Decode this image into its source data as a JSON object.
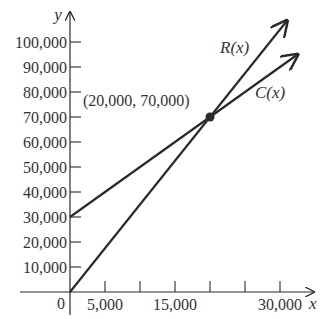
{
  "chart_data": {
    "type": "line",
    "title": "",
    "xlabel": "x",
    "ylabel": "y",
    "xlim": [
      0,
      33000
    ],
    "ylim": [
      0,
      105000
    ],
    "grid": false,
    "x_ticks": [
      5000,
      10000,
      15000,
      20000,
      25000,
      30000
    ],
    "x_tick_labels": [
      {
        "value": 5000,
        "label": "5,000"
      },
      {
        "value": 15000,
        "label": "15,000"
      },
      {
        "value": 30000,
        "label": "30,000"
      }
    ],
    "origin_label": "0",
    "y_ticks": [
      10000,
      20000,
      30000,
      40000,
      50000,
      60000,
      70000,
      80000,
      90000,
      100000
    ],
    "y_tick_labels": [
      "10,000",
      "20,000",
      "30,000",
      "40,000",
      "50,000",
      "60,000",
      "70,000",
      "80,000",
      "90,000",
      "100,000"
    ],
    "series": [
      {
        "name": "R(x)",
        "label": "R(x)",
        "points": [
          [
            0,
            0
          ],
          [
            20000,
            70000
          ],
          [
            31000,
            108500
          ]
        ],
        "slope": 3.5,
        "intercept": 0
      },
      {
        "name": "C(x)",
        "label": "C(x)",
        "points": [
          [
            0,
            30000
          ],
          [
            20000,
            70000
          ],
          [
            32500,
            95000
          ]
        ],
        "slope": 2,
        "intercept": 30000
      }
    ],
    "annotations": [
      {
        "type": "point",
        "x": 20000,
        "y": 70000,
        "label": "(20,000, 70,000)"
      }
    ]
  },
  "colors": {
    "line": "#2a2a2a",
    "text": "#333333",
    "background": "#ffffff"
  }
}
